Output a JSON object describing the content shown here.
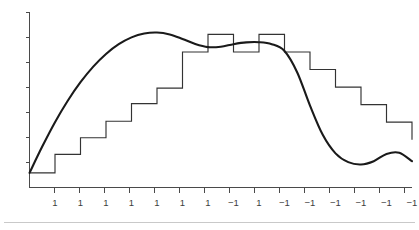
{
  "figure": {
    "title": "",
    "background_color": "#ffffff",
    "curve_color": "#1a1a1a",
    "step_color": "#333333",
    "axis_color": "#4a4a4a",
    "rule_color": "#c9c9c9"
  },
  "chart_data": {
    "type": "line",
    "title": "",
    "subtitle": "",
    "xlabel": "",
    "ylabel": "",
    "grid": false,
    "legend": null,
    "axes": {
      "x_axis_visible": true,
      "y_axis_visible": true,
      "x_tick_labels_visible": true,
      "y_tick_labels_visible": false,
      "xlim": [
        0,
        15
      ],
      "ylim": [
        0,
        9
      ]
    },
    "x_tick_labels": [
      "1",
      "1",
      "1",
      "1",
      "1",
      "1",
      "1",
      "-1",
      "1",
      "-1",
      "-1",
      "-1",
      "-1",
      "-1",
      "-1"
    ],
    "y_tick_count": 7,
    "series": [
      {
        "name": "smooth-signal",
        "type": "line",
        "style": "smooth",
        "x": [
          0.0,
          0.5,
          1.0,
          1.5,
          2.0,
          2.5,
          3.0,
          3.5,
          4.0,
          4.5,
          5.0,
          5.5,
          6.0,
          6.5,
          7.0,
          7.5,
          8.0,
          8.5,
          9.0,
          9.5,
          10.0,
          10.5,
          11.0,
          11.5,
          12.0,
          12.5,
          13.0,
          13.5,
          14.0,
          14.5,
          15.0
        ],
        "y": [
          0.75,
          2.1,
          3.35,
          4.45,
          5.4,
          6.2,
          6.85,
          7.35,
          7.7,
          7.9,
          7.95,
          7.85,
          7.62,
          7.36,
          7.2,
          7.22,
          7.35,
          7.44,
          7.45,
          7.35,
          7.0,
          5.9,
          4.2,
          2.7,
          1.75,
          1.3,
          1.18,
          1.35,
          1.72,
          1.78,
          1.35
        ]
      },
      {
        "name": "step-quantizer",
        "type": "step",
        "style": "post",
        "x": [
          0,
          1,
          2,
          3,
          4,
          5,
          6,
          7,
          8,
          9,
          10,
          11,
          12,
          13,
          14,
          15
        ],
        "y": [
          0.75,
          1.7,
          2.55,
          3.4,
          4.3,
          5.1,
          6.95,
          7.85,
          6.95,
          7.85,
          6.95,
          6.05,
          5.15,
          4.25,
          3.35,
          2.45
        ]
      }
    ]
  }
}
